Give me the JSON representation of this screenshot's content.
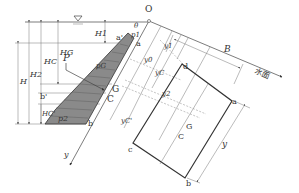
{
  "diagram": {
    "colors": {
      "shade": "#8a8a8a",
      "line": "#444444",
      "background": "#ffffff"
    },
    "labels": {
      "origin": "O",
      "theta": "θ",
      "p1": "p1",
      "pG": "pG",
      "p2": "p2",
      "P": "P",
      "a_prime": "a'",
      "b_prime": "b'",
      "a": "a",
      "b": "b",
      "c": "c",
      "d": "d",
      "G": "G",
      "C": "C",
      "H": "H",
      "H1": "H1",
      "H2": "H2",
      "HG": "HG",
      "HC": "HC",
      "HC_prime": "HC'",
      "y0": "y0",
      "yC": "yC",
      "yG": "yG",
      "y1": "y1",
      "y2": "y2",
      "yC_prime": "yC'",
      "y_axis": "y",
      "y_len": "y",
      "B": "B",
      "water_surface": "水面",
      "water_symbol": "∇"
    }
  }
}
